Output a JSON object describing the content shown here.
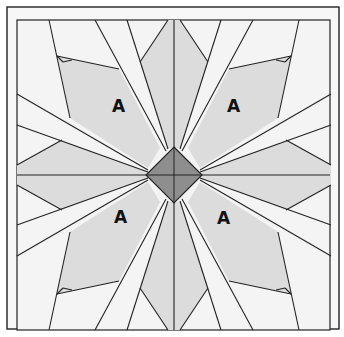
{
  "diagram": {
    "colors": {
      "background": "#f6f6f6",
      "light_fill": "#f4f4f4",
      "shaded_fill": "#dcdcdc",
      "center_fill": "#8e8e8e",
      "line": "#222222"
    },
    "labels": [
      {
        "text": "A",
        "x": 118,
        "y": 112
      },
      {
        "text": "A",
        "x": 233,
        "y": 112
      },
      {
        "text": "A",
        "x": 120,
        "y": 223
      },
      {
        "text": "A",
        "x": 223,
        "y": 224
      }
    ],
    "center_diamond": {
      "cx": 174,
      "cy": 175,
      "r": 28
    }
  }
}
